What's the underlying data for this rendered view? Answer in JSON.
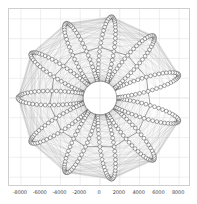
{
  "figure": {
    "background_color": "#ffffff",
    "width": 197,
    "height": 204
  },
  "axes": {
    "frame_color": "#cfcfcf",
    "grid_color": "#e4e4e4",
    "grid_on": true,
    "background_color": "#ffffff",
    "xlim": [
      -9200,
      9200
    ],
    "ylim": [
      -9000,
      9000
    ],
    "xticks": [
      -8000,
      -6000,
      -4000,
      -2000,
      0,
      2000,
      4000,
      6000,
      8000
    ],
    "xtick_labels": [
      "-8000",
      "-6000",
      "-4000",
      "-2000",
      "0",
      "2000",
      "4000",
      "6000",
      "8000"
    ],
    "yticks": [
      -8000,
      -6000,
      -4000,
      -2000,
      0,
      2000,
      4000,
      6000,
      8000
    ],
    "ytick_labels": [
      "",
      "",
      "",
      "",
      "",
      "",
      "",
      "",
      ""
    ],
    "title": "",
    "xlabel": "",
    "ylabel": ""
  },
  "chart_data": {
    "type": "line",
    "title": "",
    "xlabel": "",
    "ylabel": "",
    "xlim": [
      -9200,
      9200
    ],
    "ylim": [
      -9000,
      9000
    ],
    "grid": true,
    "legend": "none",
    "series": [
      {
        "name": "orbit-trajectory",
        "kind": "rosette",
        "line_color": "#888888",
        "line_width": 0.35,
        "marker": "open-circle",
        "marker_edge_color": "#333333",
        "marker_face_color": "none",
        "marker_size": 1.9,
        "petals": 11,
        "petal_phase_deg": 8,
        "r_apoapsis": 8300,
        "r_periapsis": 1750,
        "samples_per_petal": 46,
        "central_void_radius": 1700
      }
    ]
  }
}
